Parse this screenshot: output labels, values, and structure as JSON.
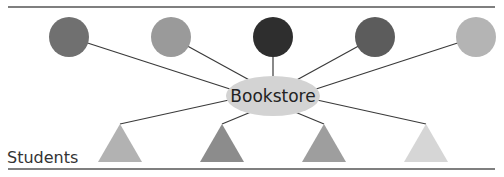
{
  "diagram": {
    "center": {
      "label": "Bookstore",
      "color": "#d3d3d3"
    },
    "row_label": "Students",
    "top_nodes": [
      {
        "shape": "circle",
        "color": "#707070"
      },
      {
        "shape": "circle",
        "color": "#9a9a9a"
      },
      {
        "shape": "circle",
        "color": "#2e2e2e"
      },
      {
        "shape": "circle",
        "color": "#5c5c5c"
      },
      {
        "shape": "circle",
        "color": "#b4b4b4"
      }
    ],
    "bottom_nodes": [
      {
        "shape": "triangle",
        "color": "#b2b2b2"
      },
      {
        "shape": "triangle",
        "color": "#8c8c8c"
      },
      {
        "shape": "triangle",
        "color": "#9e9e9e"
      },
      {
        "shape": "triangle",
        "color": "#d6d6d6"
      }
    ],
    "edge_color": "#3a3a3a",
    "rule_color": "#555555"
  }
}
